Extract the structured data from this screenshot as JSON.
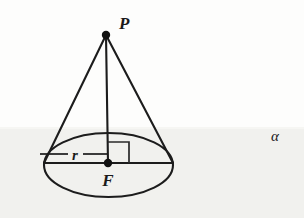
{
  "figure": {
    "type": "geometry-diagram",
    "canvas": {
      "width": 304,
      "height": 218
    },
    "background": {
      "upper_color": "#fdfdfc",
      "plane_color": "#f1f1ee",
      "plane_top_y": 127
    },
    "stroke_color": "#1c1c1c",
    "labels": {
      "apex": "P",
      "center": "F",
      "radius": "r",
      "plane": "α"
    },
    "points": {
      "apex": {
        "name": "P",
        "x": 106,
        "y": 35,
        "label_x": 119,
        "label_y": 28
      },
      "center": {
        "name": "F",
        "x": 108,
        "y": 163,
        "label_x": 108,
        "label_y": 185
      },
      "left_base": {
        "x": 44,
        "y": 163
      },
      "right_base": {
        "x": 173,
        "y": 163
      }
    },
    "base_ellipse": {
      "cx": 108.5,
      "cy": 165,
      "rx": 64.5,
      "ry": 32
    },
    "radius_segment": {
      "label": "r",
      "label_x": 75,
      "label_y": 159,
      "y": 154,
      "dash_left_x1": 40,
      "dash_left_x2": 68,
      "dash_right_x1": 83,
      "dash_right_x2": 108
    },
    "right_angle_marker": {
      "size": 21,
      "origin_x": 108,
      "origin_y": 163
    },
    "plane_label": {
      "text": "α",
      "x": 275,
      "y": 140
    }
  }
}
